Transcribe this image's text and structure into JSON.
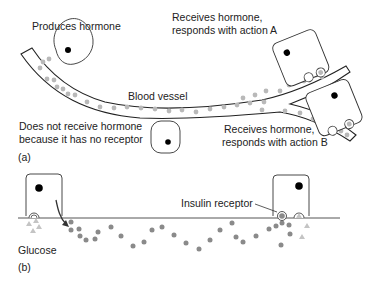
{
  "panel_a": {
    "panel_label": "(a)",
    "labels": {
      "produces": "Produces hormone",
      "receives_a_line1": "Receives hormone,",
      "receives_a_line2": "responds with action A",
      "blood_vessel": "Blood vessel",
      "no_receptor_line1": "Does not receive hormone",
      "no_receptor_line2": "because it has no receptor",
      "receives_b_line1": "Receives hormone,",
      "receives_b_line2": "responds with action B"
    }
  },
  "panel_b": {
    "panel_label": "(b)",
    "labels": {
      "insulin_receptor": "Insulin receptor",
      "glucose": "Glucose"
    }
  },
  "colors": {
    "outline": "#222222",
    "nucleus": "#000000",
    "hormone_dot": "#b9b9b9",
    "insulin_dot": "#8a8a8a",
    "glucose_triangle": "#c4c4c4"
  }
}
